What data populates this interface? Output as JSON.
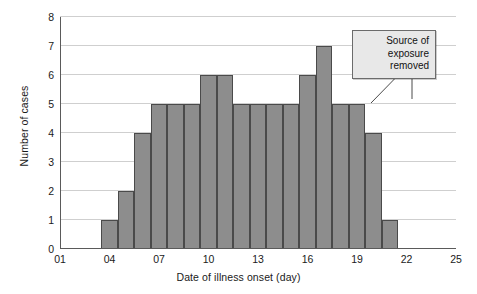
{
  "chart_data": {
    "type": "bar",
    "title": "",
    "subtitle": "",
    "xlabel": "Date of illness onset (day)",
    "ylabel": "Number of cases",
    "xlim": [
      1,
      25
    ],
    "ylim": [
      0,
      8
    ],
    "grid": true,
    "legend": null,
    "bar_color": "#8d8d8d",
    "bar_edge_color": "#4a4a4a",
    "gridline_color": "#cfcfcf",
    "axis_color": "#5a5a5a",
    "xticks": [
      "01",
      "04",
      "07",
      "10",
      "13",
      "16",
      "19",
      "22",
      "25"
    ],
    "xtick_values": [
      1,
      4,
      7,
      10,
      13,
      16,
      19,
      22,
      25
    ],
    "yticks": [
      "0",
      "1",
      "2",
      "3",
      "4",
      "5",
      "6",
      "7",
      "8"
    ],
    "ytick_values": [
      0,
      1,
      2,
      3,
      4,
      5,
      6,
      7,
      8
    ],
    "bar_width_days": 1,
    "x": [
      4,
      5,
      6,
      7,
      8,
      9,
      10,
      11,
      12,
      13,
      14,
      15,
      16,
      17,
      18,
      19,
      20,
      21
    ],
    "categories": [
      "04",
      "05",
      "06",
      "07",
      "08",
      "09",
      "10",
      "11",
      "12",
      "13",
      "14",
      "15",
      "16",
      "17",
      "18",
      "19",
      "20",
      "21"
    ],
    "values": [
      1,
      2,
      4,
      5,
      5,
      5,
      6,
      6,
      5,
      5,
      5,
      5,
      6,
      7,
      5,
      5,
      4,
      1
    ],
    "annotations": [
      {
        "text": "Source of exposure removed",
        "lines": [
          "Source of",
          "exposure",
          "removed"
        ],
        "points_to_day": 17,
        "points_to_value": 7
      }
    ]
  },
  "axis": {
    "ylabel": "Number of cases",
    "xlabel": "Date of illness onset (day)"
  },
  "callout": {
    "line1": "Source of",
    "line2": "exposure",
    "line3": "removed"
  }
}
